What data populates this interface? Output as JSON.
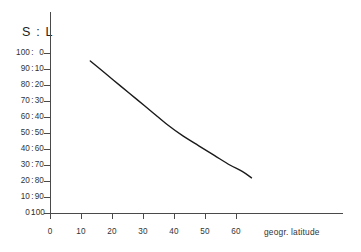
{
  "chart_data": {
    "type": "line",
    "title": "S : L",
    "xlabel": "geogr. latitude",
    "ylabel": "S : L",
    "xlim": [
      0,
      60
    ],
    "ylim": [
      0,
      100
    ],
    "grid": false,
    "legend": null,
    "x_ticks": [
      "0",
      "10",
      "20",
      "30",
      "40",
      "50",
      "60"
    ],
    "x_tick_values": [
      0,
      10,
      20,
      30,
      40,
      50,
      60
    ],
    "y_axis_dual": true,
    "y_ticks_left_label": "S",
    "y_ticks_right_label": "L",
    "y_ticks_separator": ":",
    "y_ticks_left": [
      "100",
      "90",
      "80",
      "70",
      "60",
      "50",
      "40",
      "30",
      "20",
      "10",
      "0"
    ],
    "y_ticks_right": [
      "0",
      "10",
      "20",
      "30",
      "40",
      "50",
      "60",
      "70",
      "80",
      "90",
      "100"
    ],
    "y_tick_values": [
      100,
      90,
      80,
      70,
      60,
      50,
      40,
      30,
      20,
      10,
      0
    ],
    "series": [
      {
        "name": "S:L ratio",
        "color": "#1a1a1a",
        "x": [
          13,
          18,
          23,
          28,
          33,
          38,
          43,
          48,
          53,
          58,
          62,
          65
        ],
        "values": [
          95,
          87,
          79,
          71,
          63,
          55,
          48,
          42,
          36,
          30,
          26,
          22
        ]
      }
    ]
  },
  "colors": {
    "curve": "#1a1a1a",
    "axis": "#4a4a4a",
    "text": "#333333",
    "title_text": "#222222",
    "background": "#ffffff"
  }
}
